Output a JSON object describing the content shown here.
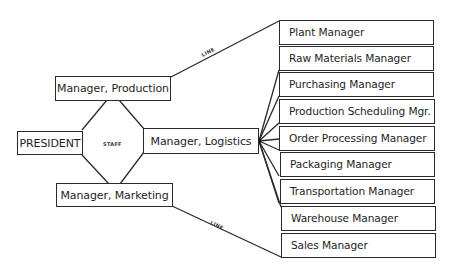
{
  "diagram": {
    "type": "organization-chart",
    "president": {
      "label": "PRESIDENT"
    },
    "staff_label": "STAFF",
    "line_labels": {
      "production": "LINE",
      "marketing": "LINE"
    },
    "managers": {
      "production": "Manager, Production",
      "logistics": "Manager, Logistics",
      "marketing": "Manager, Marketing"
    },
    "subordinates": [
      {
        "label": "Plant Manager",
        "reports_to": "Manager, Production"
      },
      {
        "label": "Raw Materials Manager",
        "reports_to": "Manager, Logistics"
      },
      {
        "label": "Purchasing Manager",
        "reports_to": "Manager, Logistics"
      },
      {
        "label": "Production Scheduling Mgr.",
        "reports_to": "Manager, Logistics"
      },
      {
        "label": "Order Processing Manager",
        "reports_to": "Manager, Logistics"
      },
      {
        "label": "Packaging Manager",
        "reports_to": "Manager, Logistics"
      },
      {
        "label": "Transportation Manager",
        "reports_to": "Manager, Logistics"
      },
      {
        "label": "Warehouse Manager",
        "reports_to": "Manager, Logistics"
      },
      {
        "label": "Sales Manager",
        "reports_to": "Manager, Marketing"
      }
    ],
    "colors": {
      "line": "#2a2a2a",
      "background": "#ffffff",
      "text": "#1e1e1e"
    }
  }
}
